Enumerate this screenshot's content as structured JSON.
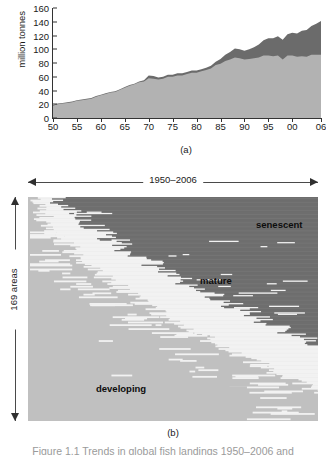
{
  "figure": {
    "panel_a_caption": "(a)",
    "panel_b_caption": "(b)",
    "clipped_caption": "Figure 1.1  Trends in global fish landings 1950–2006 and"
  },
  "chart_data": [
    {
      "id": "panel-a",
      "type": "area",
      "title": "",
      "xlabel": "",
      "ylabel": "million tonnes",
      "stacked": true,
      "grid": false,
      "legend_position": "none",
      "xlim": [
        1950,
        2006
      ],
      "ylim": [
        0,
        160
      ],
      "ytick_labels": [
        "0",
        "20",
        "40",
        "60",
        "80",
        "100",
        "120",
        "140",
        "160"
      ],
      "ytick_values": [
        0,
        20,
        40,
        60,
        80,
        100,
        120,
        140,
        160
      ],
      "xtick_labels": [
        "50",
        "55",
        "60",
        "65",
        "70",
        "75",
        "80",
        "85",
        "90",
        "95",
        "00",
        "06"
      ],
      "xtick_values": [
        1950,
        1955,
        1960,
        1965,
        1970,
        1975,
        1980,
        1985,
        1990,
        1995,
        2000,
        2006
      ],
      "x": [
        1950,
        1951,
        1952,
        1953,
        1954,
        1955,
        1956,
        1957,
        1958,
        1959,
        1960,
        1961,
        1962,
        1963,
        1964,
        1965,
        1966,
        1967,
        1968,
        1969,
        1970,
        1971,
        1972,
        1973,
        1974,
        1975,
        1976,
        1977,
        1978,
        1979,
        1980,
        1981,
        1982,
        1983,
        1984,
        1985,
        1986,
        1987,
        1988,
        1989,
        1990,
        1991,
        1992,
        1993,
        1994,
        1995,
        1996,
        1997,
        1998,
        1999,
        2000,
        2001,
        2002,
        2003,
        2004,
        2005,
        2006
      ],
      "series": [
        {
          "name": "lower-band",
          "color": "#b2b2b2",
          "values": [
            18,
            20,
            21,
            22,
            23,
            25,
            26,
            27,
            28,
            31,
            33,
            35,
            37,
            38,
            41,
            44,
            47,
            49,
            52,
            53,
            58,
            57,
            56,
            57,
            60,
            60,
            62,
            62,
            64,
            66,
            66,
            68,
            70,
            72,
            77,
            79,
            83,
            85,
            88,
            87,
            85,
            86,
            87,
            88,
            91,
            91,
            90,
            91,
            85,
            91,
            91,
            89,
            90,
            89,
            92,
            92,
            92
          ]
        },
        {
          "name": "upper-band",
          "color": "#6b6b6b",
          "values": [
            1,
            1,
            1,
            1,
            1,
            1,
            1,
            1,
            1,
            1,
            1,
            1,
            1,
            1,
            1,
            1,
            1,
            1,
            1,
            2,
            4,
            4,
            3,
            3,
            3,
            3,
            3,
            3,
            3,
            3,
            3,
            3,
            3,
            4,
            5,
            7,
            9,
            11,
            13,
            13,
            13,
            14,
            16,
            19,
            22,
            25,
            26,
            28,
            29,
            31,
            33,
            34,
            37,
            39,
            42,
            45,
            49
          ]
        }
      ],
      "total_top_value_2006": 141
    },
    {
      "id": "panel-b",
      "type": "heatmap",
      "title": "",
      "x_range_label": "1950–2006",
      "y_axis_label": "169 areas",
      "n_rows": 169,
      "n_cols": 57,
      "grid": false,
      "legend_position": "in-plot annotations",
      "categories": [
        {
          "name": "developing",
          "color": "#c0c0c0"
        },
        {
          "name": "mature",
          "color": "#f2f2f2"
        },
        {
          "name": "senescent",
          "color": "#6e6e6e"
        }
      ],
      "annotations": [
        {
          "text": "senescent",
          "x_frac": 0.79,
          "y_frac": 0.1
        },
        {
          "text": "mature",
          "x_frac": 0.59,
          "y_frac": 0.35
        },
        {
          "text": "developing",
          "x_frac": 0.24,
          "y_frac": 0.83
        }
      ],
      "description": "Rows are 169 fishing areas sorted by the year each area transitions from developing to mature to senescent; transition boundaries sweep from the upper left toward the lower right."
    }
  ],
  "panel_a": {
    "ylabel": "million tonnes",
    "yticks": [
      "0",
      "20",
      "40",
      "60",
      "80",
      "100",
      "120",
      "140",
      "160"
    ],
    "xticks": [
      "50",
      "55",
      "60",
      "65",
      "70",
      "75",
      "80",
      "85",
      "90",
      "95",
      "00",
      "06"
    ],
    "caption": "(a)"
  },
  "panel_b": {
    "range_label": "1950–2006",
    "areas_label": "169 areas",
    "labels": {
      "senescent": "senescent",
      "mature": "mature",
      "developing": "developing"
    },
    "caption": "(b)"
  },
  "colors": {
    "band_light": "#b2b2b2",
    "band_dark": "#6b6b6b",
    "heatmap_developing": "#c0c0c0",
    "heatmap_mature": "#f2f2f2",
    "heatmap_senescent": "#6e6e6e",
    "axis": "#333333",
    "text": "#1a1a1a"
  }
}
